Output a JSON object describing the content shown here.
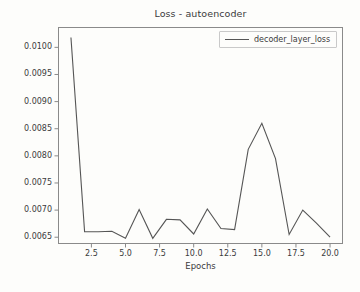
{
  "chart_data": {
    "type": "line",
    "title": "Loss - autoencoder",
    "xlabel": "Epochs",
    "ylabel": "",
    "x": [
      1,
      2,
      3,
      4,
      5,
      6,
      7,
      8,
      9,
      10,
      11,
      12,
      13,
      14,
      15,
      16,
      17,
      18,
      19,
      20
    ],
    "series": [
      {
        "name": "decoder_layer_loss",
        "color": "#555555",
        "values": [
          0.01018,
          0.0066,
          0.0066,
          0.00661,
          0.00648,
          0.00701,
          0.00648,
          0.00683,
          0.00682,
          0.00656,
          0.00702,
          0.00666,
          0.00664,
          0.00812,
          0.0086,
          0.00795,
          0.00655,
          0.007,
          0.00676,
          0.0065
        ]
      }
    ],
    "xlim": [
      0.05,
      20.95
    ],
    "ylim": [
      0.006375,
      0.010375
    ],
    "xticks": [
      2.5,
      5.0,
      7.5,
      10.0,
      12.5,
      15.0,
      17.5,
      20.0
    ],
    "xtick_labels": [
      "2.5",
      "5.0",
      "7.5",
      "10.0",
      "12.5",
      "15.0",
      "17.5",
      "20.0"
    ],
    "yticks": [
      0.0065,
      0.007,
      0.0075,
      0.008,
      0.0085,
      0.009,
      0.0095,
      0.01
    ],
    "ytick_labels": [
      "0.0065",
      "0.0070",
      "0.0075",
      "0.0080",
      "0.0085",
      "0.0090",
      "0.0095",
      "0.0100"
    ],
    "grid": false,
    "legend": {
      "position": "upper right",
      "entries": [
        "decoder_layer_loss"
      ]
    }
  },
  "legend": {
    "label": "decoder_layer_loss"
  },
  "axis": {
    "xlabel": "Epochs",
    "title": "Loss - autoencoder"
  },
  "colors": {
    "line": "#555555",
    "axis": "#8a8a8a",
    "text": "#3b3b3b",
    "background": "#fdfdfb"
  }
}
